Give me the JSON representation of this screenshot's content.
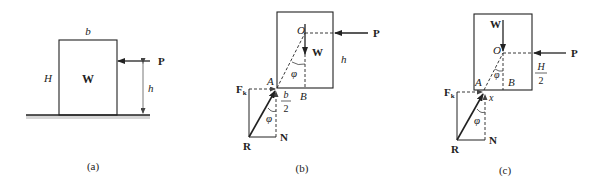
{
  "figure_a": {
    "caption": "(a)",
    "width_label": "b",
    "height_label": "H",
    "weight_label": "W",
    "force_label": "P",
    "force_height_label": "h"
  },
  "figure_b": {
    "caption": "(b)",
    "center_label": "O",
    "weight_label": "W",
    "force_label": "P",
    "height_label": "h",
    "angle_label": "φ",
    "pivot_label": "A",
    "point_b_label": "B",
    "half_width_num": "b",
    "half_width_den": "2",
    "friction_label": "F",
    "friction_sub": "k",
    "normal_label": "N",
    "resultant_label": "R",
    "angle_label_2": "φ"
  },
  "figure_c": {
    "caption": "(c)",
    "center_label": "O",
    "weight_label": "W",
    "force_label": "P",
    "half_height_num": "H",
    "half_height_den": "2",
    "angle_label": "φ",
    "pivot_label": "A",
    "point_b_label": "B",
    "offset_label": "x",
    "friction_label": "F",
    "friction_sub": "k",
    "normal_label": "N",
    "resultant_label": "R",
    "angle_label_2": "φ"
  },
  "colors": {
    "line": "#222222",
    "ground_shadow": "#c8c8c8"
  }
}
